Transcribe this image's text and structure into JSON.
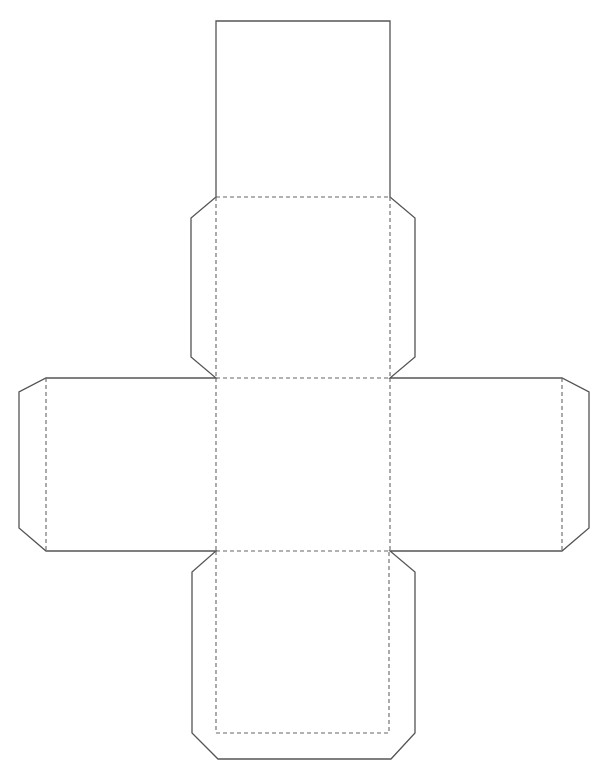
{
  "diagram": {
    "type": "cube-net-template",
    "faces": 6,
    "layout": "cross",
    "legend": {
      "solid_line": "cut line",
      "dashed_line": "fold line"
    },
    "colors": {
      "background": "#ffffff",
      "cut_line": "#555555",
      "fold_line": "#666666"
    },
    "geometry": {
      "column_x": [
        216,
        390
      ],
      "row_y": [
        21,
        197,
        378,
        551,
        733
      ],
      "left_arm_x": [
        19,
        46
      ],
      "right_arm_x": [
        562,
        589
      ],
      "flap_x": [
        191,
        415
      ],
      "bottom_edge_y": 759
    }
  }
}
